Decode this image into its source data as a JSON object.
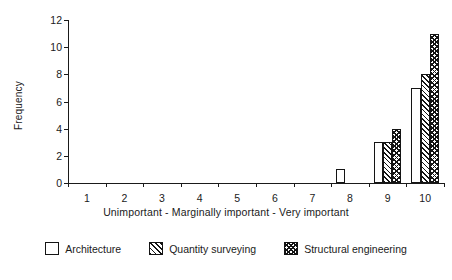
{
  "chart_data": {
    "type": "bar",
    "title": "",
    "subtitle": "",
    "xlabel": "Unimportant  -  Marginally important  -  Very important",
    "ylabel": "Frequency",
    "categories": [
      "1",
      "2",
      "3",
      "4",
      "5",
      "6",
      "7",
      "8",
      "9",
      "10"
    ],
    "series": [
      {
        "name": "Architecture",
        "pattern": "solid-white",
        "values": [
          0,
          0,
          0,
          0,
          0,
          0,
          0,
          1,
          3,
          7
        ]
      },
      {
        "name": "Quantity surveying",
        "pattern": "diagonal-hatch",
        "values": [
          0,
          0,
          0,
          0,
          0,
          0,
          0,
          0,
          3,
          8
        ]
      },
      {
        "name": "Structural engineering",
        "pattern": "cross-hatch",
        "values": [
          0,
          0,
          0,
          0,
          0,
          0,
          0,
          0,
          4,
          11
        ]
      }
    ],
    "ylim": [
      0,
      12
    ],
    "yticks": [
      0,
      2,
      4,
      6,
      8,
      10,
      12
    ],
    "xlim_categories": [
      1,
      10
    ],
    "grid": false,
    "legend_position": "bottom",
    "colors": {
      "line": "#141414",
      "fill": "#ffffff",
      "background": "#ffffff"
    }
  },
  "legend": {
    "items": [
      {
        "label": "Architecture"
      },
      {
        "label": "Quantity surveying"
      },
      {
        "label": "Structural engineering"
      }
    ]
  }
}
